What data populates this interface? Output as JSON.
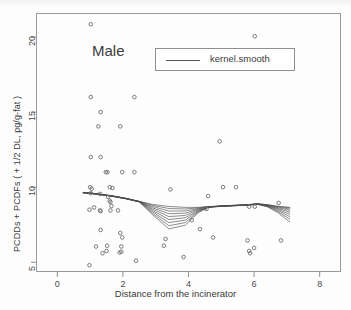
{
  "chart_data": {
    "type": "scatter",
    "title": "",
    "panel_label": "Male",
    "xlabel": "Distance from the incinerator",
    "ylabel": "PCDDs + PCDFs ( + 1/2 DL, pg/g-fat )",
    "xlim": [
      -0.65,
      8.65
    ],
    "ylim": [
      4.35,
      21.6
    ],
    "xticks": [
      0,
      2,
      4,
      6,
      8
    ],
    "yticks": [
      5,
      10,
      15,
      20
    ],
    "xtick_labels": [
      "0",
      "2",
      "4",
      "6",
      "8"
    ],
    "ytick_labels": [
      "5",
      "10",
      "15",
      "20"
    ],
    "grid": false,
    "legend": {
      "position": "top-center",
      "entries": [
        {
          "label": "kernel.smooth",
          "marker": "line",
          "color": "#555555"
        }
      ]
    },
    "marker": {
      "shape": "open-circle",
      "size": 3.6,
      "color": "#6d6d6d"
    },
    "points": [
      {
        "x": 1.02,
        "y": 20.85
      },
      {
        "x": 6.02,
        "y": 20.05
      },
      {
        "x": 1.02,
        "y": 16.0
      },
      {
        "x": 2.35,
        "y": 16.0
      },
      {
        "x": 1.32,
        "y": 15.0
      },
      {
        "x": 1.25,
        "y": 14.05
      },
      {
        "x": 1.92,
        "y": 14.05
      },
      {
        "x": 4.95,
        "y": 13.05
      },
      {
        "x": 1.02,
        "y": 12.0
      },
      {
        "x": 1.32,
        "y": 12.0
      },
      {
        "x": 1.48,
        "y": 11.0
      },
      {
        "x": 1.53,
        "y": 11.0
      },
      {
        "x": 1.98,
        "y": 11.0
      },
      {
        "x": 2.35,
        "y": 11.0
      },
      {
        "x": 1.0,
        "y": 10.0
      },
      {
        "x": 1.05,
        "y": 9.9
      },
      {
        "x": 1.6,
        "y": 10.0
      },
      {
        "x": 1.68,
        "y": 9.95
      },
      {
        "x": 3.45,
        "y": 9.85
      },
      {
        "x": 5.05,
        "y": 10.0
      },
      {
        "x": 5.45,
        "y": 10.0
      },
      {
        "x": 1.02,
        "y": 9.6
      },
      {
        "x": 1.3,
        "y": 9.55
      },
      {
        "x": 1.55,
        "y": 9.35
      },
      {
        "x": 4.6,
        "y": 9.4
      },
      {
        "x": 1.6,
        "y": 9.1
      },
      {
        "x": 1.62,
        "y": 9.0
      },
      {
        "x": 1.65,
        "y": 8.75
      },
      {
        "x": 6.75,
        "y": 8.95
      },
      {
        "x": 0.98,
        "y": 8.5
      },
      {
        "x": 1.12,
        "y": 8.65
      },
      {
        "x": 1.3,
        "y": 8.45
      },
      {
        "x": 1.32,
        "y": 8.4
      },
      {
        "x": 1.62,
        "y": 8.45
      },
      {
        "x": 1.85,
        "y": 8.45
      },
      {
        "x": 4.5,
        "y": 8.6
      },
      {
        "x": 4.55,
        "y": 8.55
      },
      {
        "x": 5.85,
        "y": 8.7
      },
      {
        "x": 6.02,
        "y": 8.7
      },
      {
        "x": 1.32,
        "y": 7.15
      },
      {
        "x": 4.1,
        "y": 7.8
      },
      {
        "x": 1.92,
        "y": 6.95
      },
      {
        "x": 4.35,
        "y": 7.2
      },
      {
        "x": 1.98,
        "y": 6.65
      },
      {
        "x": 1.18,
        "y": 6.05
      },
      {
        "x": 1.52,
        "y": 6.1
      },
      {
        "x": 1.95,
        "y": 6.05
      },
      {
        "x": 3.3,
        "y": 6.55
      },
      {
        "x": 3.25,
        "y": 6.1
      },
      {
        "x": 4.75,
        "y": 6.65
      },
      {
        "x": 5.8,
        "y": 6.45
      },
      {
        "x": 6.82,
        "y": 6.45
      },
      {
        "x": 1.38,
        "y": 5.6
      },
      {
        "x": 1.5,
        "y": 5.75
      },
      {
        "x": 1.95,
        "y": 5.7
      },
      {
        "x": 1.9,
        "y": 5.65
      },
      {
        "x": 5.85,
        "y": 5.75
      },
      {
        "x": 6.0,
        "y": 5.95
      },
      {
        "x": 5.88,
        "y": 5.6
      },
      {
        "x": 2.4,
        "y": 5.1
      },
      {
        "x": 3.85,
        "y": 5.35
      },
      {
        "x": 0.98,
        "y": 4.8
      }
    ],
    "smooth_curves": {
      "description": "family of kernel.smooth fits with increasing bandwidth",
      "color": "#4c4c4c",
      "count": 9,
      "x_start": 0.78,
      "x_end": 7.1
    }
  }
}
